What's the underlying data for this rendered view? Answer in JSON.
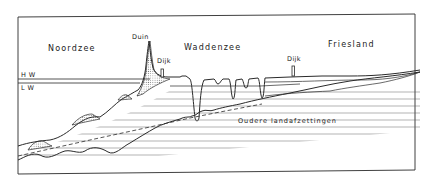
{
  "diagram": {
    "type": "geological-cross-section",
    "regions": {
      "north_sea": "Noordzee",
      "wadden_sea": "Waddenzee",
      "friesland": "Friesland"
    },
    "features": {
      "dune": "Duin",
      "dike_left": "Dijk",
      "dike_right": "Dijk"
    },
    "water_levels": {
      "high": "H W",
      "low": "L W"
    },
    "deposits": {
      "older": "Oudere  landafzettingen"
    },
    "colors": {
      "line": "#2a2a2a",
      "background": "#ffffff",
      "stipple": "#888888"
    }
  }
}
